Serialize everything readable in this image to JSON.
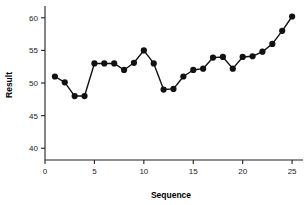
{
  "chart_data": {
    "type": "line",
    "title": "",
    "xlabel": "Sequence",
    "ylabel": "Result",
    "xlim": [
      0,
      25.8
    ],
    "ylim": [
      38.2,
      61.5
    ],
    "xticks": [
      0,
      5,
      10,
      15,
      20,
      25
    ],
    "xtick_labels": [
      "0",
      "5",
      "10",
      "15",
      "20",
      "25"
    ],
    "yticks": [
      40,
      45,
      50,
      55,
      60
    ],
    "ytick_labels": [
      "40",
      "45",
      "50",
      "55",
      "60"
    ],
    "grid": false,
    "legend": null,
    "marker": "filled-circle",
    "marker_color": "#111111",
    "line_color": "#111111",
    "x": [
      1,
      2,
      3,
      4,
      5,
      6,
      7,
      8,
      9,
      10,
      11,
      12,
      13,
      14,
      15,
      16,
      17,
      18,
      19,
      20,
      21,
      22,
      23,
      24,
      25
    ],
    "values": [
      51.0,
      50.1,
      48.0,
      48.0,
      53.0,
      53.0,
      53.0,
      52.0,
      53.1,
      55.0,
      53.0,
      49.0,
      49.1,
      51.0,
      52.0,
      52.2,
      53.9,
      54.0,
      52.2,
      54.0,
      54.1,
      54.8,
      56.0,
      58.0,
      60.2
    ],
    "series": [
      {
        "name": "Result",
        "values": [
          51.0,
          50.1,
          48.0,
          48.0,
          53.0,
          53.0,
          53.0,
          52.0,
          53.1,
          55.0,
          53.0,
          49.0,
          49.1,
          51.0,
          52.0,
          52.2,
          53.9,
          54.0,
          52.2,
          54.0,
          54.1,
          54.8,
          56.0,
          58.0,
          60.2
        ]
      }
    ]
  }
}
